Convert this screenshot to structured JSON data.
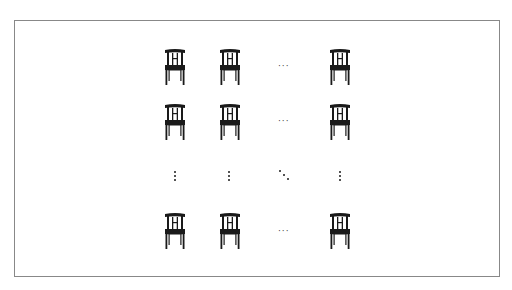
{
  "diagram": {
    "rows_shown": [
      "row-1",
      "row-2",
      "row-last"
    ],
    "cols_shown": [
      "col-1",
      "col-2",
      "col-last"
    ],
    "icon": "chair-icon",
    "horizontal_ellipsis": "···",
    "vertical_ellipsis": "⋮",
    "diagonal_ellipsis": "⋱",
    "colors": {
      "frame": "#888888",
      "icon": "#1a1a1a",
      "background": "#ffffff"
    }
  }
}
